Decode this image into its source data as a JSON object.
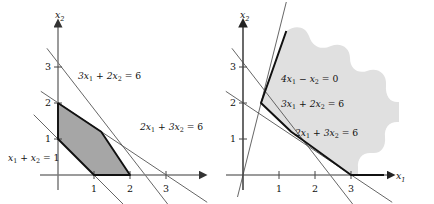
{
  "figure": {
    "background": "#ffffff",
    "ink": "#111111",
    "thin_line_color": "#555555",
    "axis_color": "#4d4d4d",
    "shade_left": "#a6a6a6",
    "shade_right": "#e0e0e0",
    "unit_px": 36
  },
  "panels": [
    {
      "id": "left",
      "name": "feasible-polygon-panel",
      "origin": {
        "x": 58,
        "y": 175
      },
      "axes": {
        "x_label": "x",
        "x_label_sub": "1",
        "y_label": "x",
        "y_label_sub": "2",
        "x_ticks": [
          {
            "value": 1,
            "label": "1"
          },
          {
            "value": 2,
            "label": "2"
          },
          {
            "value": 3,
            "label": "3"
          }
        ],
        "y_ticks": [
          {
            "value": 1,
            "label": "1"
          },
          {
            "value": 2,
            "label": "2"
          },
          {
            "value": 3,
            "label": "3"
          }
        ]
      },
      "constraint_labels": [
        {
          "name": "label-3x1-2x2-eq-6",
          "text": "3x1 + 2x2 = 6",
          "x": 78,
          "y": 79
        },
        {
          "name": "label-2x1-3x2-eq-6",
          "text": "2x1 + 3x2 = 6",
          "x": 140,
          "y": 130
        },
        {
          "name": "label-x1-x2-eq-1",
          "text": "x1 + x2 = 1",
          "x": 8,
          "y": 161
        }
      ],
      "region": {
        "name": "feasible-region",
        "fill": "#a6a6a6",
        "vertices": [
          {
            "x1": 0,
            "x2": 2
          },
          {
            "x1": 1.2,
            "x2": 1.2
          },
          {
            "x1": 2,
            "x2": 0
          },
          {
            "x1": 1,
            "x2": 0
          },
          {
            "x1": 0,
            "x2": 1
          }
        ]
      },
      "lines": [
        {
          "name": "line-3x1-2x2-eq-6",
          "a": 3,
          "b": 2,
          "c": 6
        },
        {
          "name": "line-2x1-3x2-eq-6",
          "a": 2,
          "b": 3,
          "c": 6
        },
        {
          "name": "line-x1-x2-eq-1",
          "a": 1,
          "b": 1,
          "c": 1
        }
      ]
    },
    {
      "id": "right",
      "name": "unbounded-region-panel",
      "origin": {
        "x": 243,
        "y": 175
      },
      "axes": {
        "x_label": "x",
        "x_label_sub": "1",
        "y_label": "x",
        "y_label_sub": "2",
        "x_ticks": [
          {
            "value": 1,
            "label": "1"
          },
          {
            "value": 2,
            "label": "2"
          },
          {
            "value": 3,
            "label": "3"
          }
        ],
        "y_ticks": [
          {
            "value": 1,
            "label": "1"
          },
          {
            "value": 2,
            "label": "2"
          },
          {
            "value": 3,
            "label": "3"
          }
        ]
      },
      "constraint_labels": [
        {
          "name": "label-4x1-minus-x2-eq-0",
          "text": "4x1 - x2 = 0",
          "x": 281,
          "y": 82
        },
        {
          "name": "label-3x1-2x2-eq-6",
          "text": "3x1 + 2x2 = 6",
          "x": 281,
          "y": 107
        },
        {
          "name": "label-2x1-3x2-eq-6",
          "text": "2x1 + 3x2 = 6",
          "x": 295,
          "y": 136
        }
      ],
      "region": {
        "name": "unbounded-feasible-region",
        "fill": "#e0e0e0"
      },
      "lines": [
        {
          "name": "line-4x1-minus-x2-eq-0",
          "a": 4,
          "b": -1,
          "c": 0
        },
        {
          "name": "line-3x1-2x2-eq-6",
          "a": 3,
          "b": 2,
          "c": 6
        },
        {
          "name": "line-2x1-3x2-eq-6",
          "a": 2,
          "b": 3,
          "c": 6
        }
      ],
      "boundary_vertices": [
        {
          "x1": 0.5,
          "x2": 2
        },
        {
          "x1": 1.2,
          "x2": 1.2
        },
        {
          "x1": 3,
          "x2": 0
        }
      ]
    }
  ]
}
